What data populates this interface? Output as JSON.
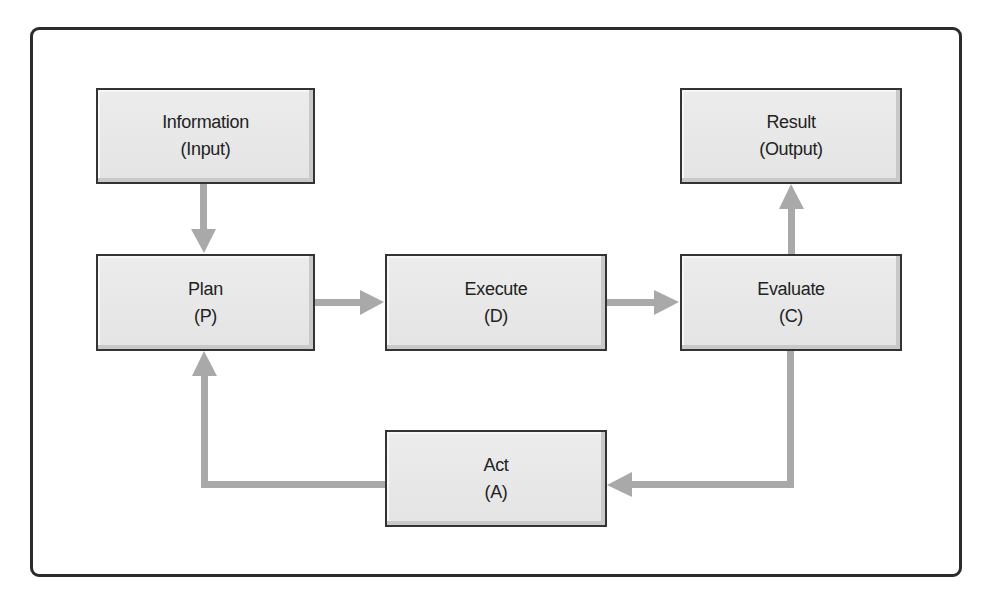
{
  "diagram": {
    "type": "flowchart",
    "title": "",
    "nodes": [
      {
        "id": "information",
        "label": "Information",
        "sublabel": "(Input)"
      },
      {
        "id": "plan",
        "label": "Plan",
        "sublabel": "(P)"
      },
      {
        "id": "execute",
        "label": "Execute",
        "sublabel": "(D)"
      },
      {
        "id": "evaluate",
        "label": "Evaluate",
        "sublabel": "(C)"
      },
      {
        "id": "result",
        "label": "Result",
        "sublabel": "(Output)"
      },
      {
        "id": "act",
        "label": "Act",
        "sublabel": "(A)"
      }
    ],
    "edges": [
      {
        "from": "information",
        "to": "plan"
      },
      {
        "from": "plan",
        "to": "execute"
      },
      {
        "from": "execute",
        "to": "evaluate"
      },
      {
        "from": "evaluate",
        "to": "result"
      },
      {
        "from": "evaluate",
        "to": "act"
      },
      {
        "from": "act",
        "to": "plan"
      }
    ],
    "colors": {
      "box_fill": "#e8e8e8",
      "box_border": "#333333",
      "arrow": "#a9a9a9",
      "frame": "#2b2b2b"
    }
  }
}
